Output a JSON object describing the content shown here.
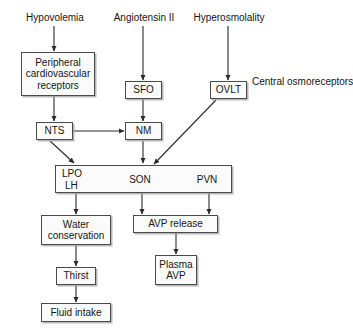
{
  "diagram": {
    "background_color": "#ffffff",
    "line_color": "#2b2b2b",
    "box_fill": "#fbfbfb",
    "box_border": "#4a4a4a",
    "stimuli": [
      {
        "id": "hypovolemia",
        "label": "Hypovolemia"
      },
      {
        "id": "angiotensin2",
        "label": "Angiotensin II"
      },
      {
        "id": "hyperosmolality",
        "label": "Hyperosmolality"
      }
    ],
    "annotations": [
      {
        "id": "central-osmoreceptors",
        "line1": "Central",
        "line2": "osmoreceptors"
      }
    ],
    "nodes": [
      {
        "id": "peripheral-receptors",
        "line1": "Peripheral",
        "line2": "cardiovascular",
        "line3": "receptors"
      },
      {
        "id": "sfo",
        "line1": "SFO"
      },
      {
        "id": "ovlt",
        "line1": "OVLT"
      },
      {
        "id": "nts",
        "line1": "NTS"
      },
      {
        "id": "nm",
        "line1": "NM"
      },
      {
        "id": "region",
        "lpo": "LPO",
        "lh": "LH",
        "son": "SON",
        "pvn": "PVN"
      },
      {
        "id": "water-conservation",
        "line1": "Water",
        "line2": "conservation"
      },
      {
        "id": "avp-release",
        "line1": "AVP release"
      },
      {
        "id": "thirst",
        "line1": "Thirst"
      },
      {
        "id": "plasma-avp",
        "line1": "Plasma",
        "line2": "AVP"
      },
      {
        "id": "fluid-intake",
        "line1": "Fluid intake"
      }
    ],
    "edges": [
      {
        "from": "hypovolemia",
        "to": "peripheral-receptors",
        "kind": "arrow-down"
      },
      {
        "from": "angiotensin2",
        "to": "sfo",
        "kind": "arrow-down"
      },
      {
        "from": "hyperosmolality",
        "to": "ovlt",
        "kind": "arrow-down"
      },
      {
        "from": "peripheral-receptors",
        "to": "nts",
        "kind": "arrow-down"
      },
      {
        "from": "sfo",
        "to": "nm",
        "kind": "arrow-down"
      },
      {
        "from": "nts",
        "to": "nm",
        "kind": "arrow-right"
      },
      {
        "from": "nts",
        "to": "region",
        "kind": "arrow-diagonal"
      },
      {
        "from": "nm",
        "to": "region",
        "kind": "arrow-down"
      },
      {
        "from": "ovlt",
        "to": "region",
        "kind": "arrow-diagonal"
      },
      {
        "from": "region",
        "to": "water-conservation",
        "kind": "arrow-down"
      },
      {
        "from": "region",
        "to": "avp-release",
        "kind": "arrow-down"
      },
      {
        "from": "region",
        "to": "avp-release-2",
        "kind": "arrow-down"
      },
      {
        "from": "water-conservation",
        "to": "thirst",
        "kind": "arrow-down"
      },
      {
        "from": "avp-release",
        "to": "plasma-avp",
        "kind": "arrow-down"
      },
      {
        "from": "thirst",
        "to": "fluid-intake",
        "kind": "arrow-down"
      }
    ]
  }
}
